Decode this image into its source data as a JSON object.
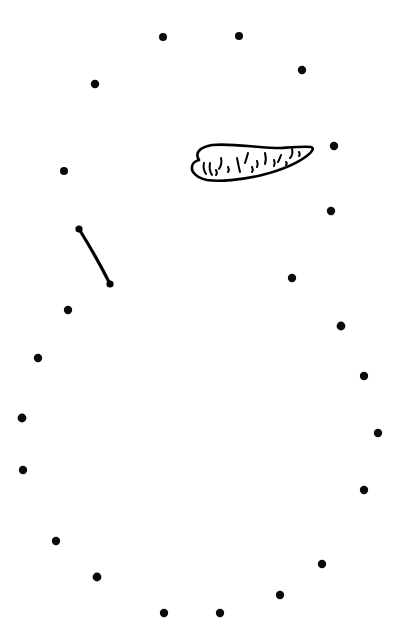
{
  "canvas": {
    "width": 405,
    "height": 633,
    "background_color": "#ffffff",
    "ink_color": "#000000",
    "title": "",
    "caption": ""
  },
  "dots": {
    "name": "perimeter-dot-ring",
    "count": 24,
    "radius": 4.2,
    "color": "#0a0a0a",
    "points": [
      {
        "id": 1,
        "x": 163,
        "y": 37,
        "r": 4.0
      },
      {
        "id": 2,
        "x": 239,
        "y": 36,
        "r": 4.0
      },
      {
        "id": 3,
        "x": 302,
        "y": 70,
        "r": 4.2
      },
      {
        "id": 4,
        "x": 95,
        "y": 84,
        "r": 4.2
      },
      {
        "id": 5,
        "x": 334,
        "y": 146,
        "r": 4.2
      },
      {
        "id": 6,
        "x": 64,
        "y": 171,
        "r": 4.0
      },
      {
        "id": 7,
        "x": 331,
        "y": 211,
        "r": 4.2
      },
      {
        "id": 8,
        "x": 292,
        "y": 278,
        "r": 4.2
      },
      {
        "id": 9,
        "x": 68,
        "y": 310,
        "r": 4.2
      },
      {
        "id": 10,
        "x": 341,
        "y": 326,
        "r": 4.4
      },
      {
        "id": 11,
        "x": 38,
        "y": 358,
        "r": 4.2
      },
      {
        "id": 12,
        "x": 364,
        "y": 376,
        "r": 4.2
      },
      {
        "id": 13,
        "x": 22,
        "y": 418,
        "r": 4.4
      },
      {
        "id": 14,
        "x": 378,
        "y": 433,
        "r": 4.2
      },
      {
        "id": 15,
        "x": 23,
        "y": 470,
        "r": 4.2
      },
      {
        "id": 16,
        "x": 26,
        "y": 472,
        "r": 0.0
      },
      {
        "id": 17,
        "x": 364,
        "y": 490,
        "r": 4.2
      },
      {
        "id": 18,
        "x": 56,
        "y": 541,
        "r": 4.2
      },
      {
        "id": 19,
        "x": 322,
        "y": 564,
        "r": 4.2
      },
      {
        "id": 20,
        "x": 97,
        "y": 577,
        "r": 4.4
      },
      {
        "id": 21,
        "x": 280,
        "y": 595,
        "r": 4.2
      },
      {
        "id": 22,
        "x": 164,
        "y": 613,
        "r": 4.2
      },
      {
        "id": 23,
        "x": 220,
        "y": 613,
        "r": 4.2
      },
      {
        "id": 24,
        "x": 7,
        "y": 469,
        "r": 0.0
      }
    ]
  },
  "strokes": {
    "name": "user-drawn-strokes",
    "items": [
      {
        "id": "curve-stroke",
        "label": "curved line segment",
        "stroke_width": 3.2,
        "color": "#000000",
        "path": "M 79 229 C 89 245, 98 260, 110 284",
        "cap_start": {
          "x": 79,
          "y": 229,
          "r": 3.6
        },
        "cap_end": {
          "x": 110,
          "y": 284,
          "r": 3.6
        }
      }
    ]
  },
  "doodle": {
    "name": "carrot-doodle",
    "label": "hand drawn carrot",
    "outline_color": "#000000",
    "outline_width": 2.6,
    "outline_path": "M 199 160 C 194 152, 201 147, 212 145 C 232 143, 258 148, 281 148 C 295 147, 306 146, 311 147 C 314 148, 313 151, 308 155 C 298 163, 282 170, 262 175 C 241 180, 219 182, 207 180 C 197 178, 191 172, 192 167 C 192 164, 195 161, 199 160 Z",
    "speckles": [
      {
        "id": 1,
        "path": "M 204 163 C 203 167, 204 171, 206 174"
      },
      {
        "id": 2,
        "path": "M 210 163 C 209 168, 210 172, 212 175"
      },
      {
        "id": 3,
        "path": "M 221 158 C 222 162, 221 166, 219 169"
      },
      {
        "id": 4,
        "path": "M 228 167 C 229 169, 229 171, 228 172"
      },
      {
        "id": 5,
        "path": "M 237 158 C 238 163, 239 168, 240 172"
      },
      {
        "id": 6,
        "path": "M 248 153 C 247 157, 246 160, 245 163"
      },
      {
        "id": 7,
        "path": "M 257 161 C 258 163, 258 165, 257 167"
      },
      {
        "id": 8,
        "path": "M 265 153 C 266 157, 266 161, 265 164"
      },
      {
        "id": 9,
        "path": "M 274 160 C 275 162, 275 164, 274 166"
      },
      {
        "id": 10,
        "path": "M 281 155 C 280 158, 279 160, 278 162"
      },
      {
        "id": 11,
        "path": "M 286 162 C 287 163, 287 164, 286 165"
      },
      {
        "id": 12,
        "path": "M 292 149 C 293 153, 292 156, 290 158"
      },
      {
        "id": 13,
        "path": "M 299 152 C 300 154, 300 155, 299 156"
      },
      {
        "id": 14,
        "path": "M 216 170 C 217 172, 217 174, 216 175"
      },
      {
        "id": 15,
        "path": "M 252 167 C 253 169, 253 171, 252 172"
      }
    ],
    "speckle_width": 2.0
  },
  "meta": {
    "instructions": "",
    "status": ""
  }
}
